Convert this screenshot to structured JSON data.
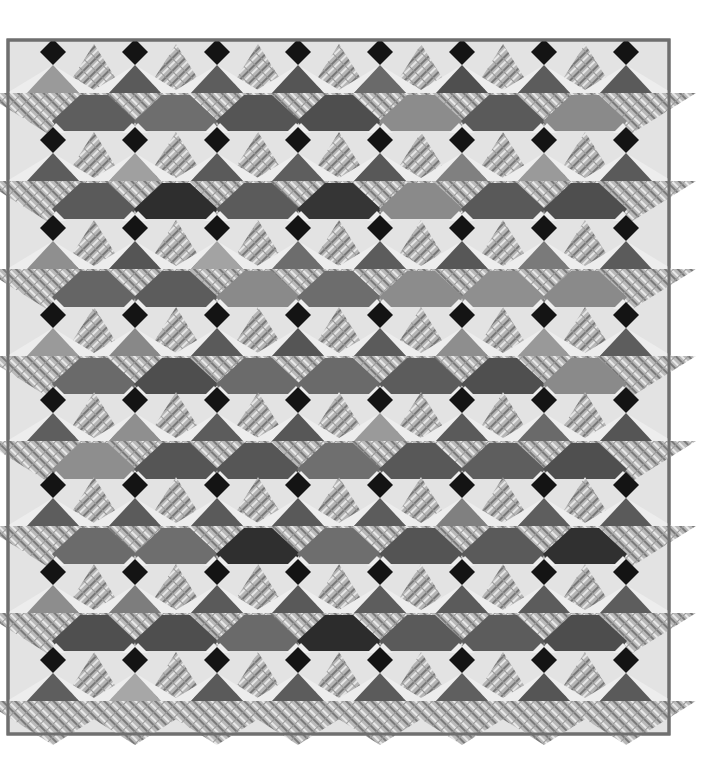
{
  "image": {
    "subject": "Patchwork quilt with black diamonds, flying-geese plaid triangles and colored trapezoid patches",
    "background": "#ffffff",
    "quilt": {
      "left": 8,
      "top": 40,
      "right": 669,
      "bottom": 734,
      "binding_color": "#6f6f6f",
      "border_color": "#e3e3e3",
      "light_color": "#ededed",
      "diamond_color": "#141414",
      "plaid_base": "#b9b9b9",
      "plaid_stripe_dark": "#7a7a7a",
      "plaid_stripe_light": "#e9e9e9"
    },
    "grid": {
      "columns_x": [
        53,
        135,
        217,
        298,
        380,
        462,
        544,
        626
      ],
      "rows_y": [
        52,
        140,
        228,
        315,
        400,
        485,
        572,
        660
      ],
      "diamond_half": 13,
      "small_tri_height": 30,
      "small_tri_half_width": 26,
      "goose_half_width": 70,
      "goose_height": 40,
      "trap_top_half": 24,
      "trap_bottom_half": 42,
      "trap_height": 38
    },
    "small_triangle_tones": [
      [
        "#9a9a9a",
        "#5a5a5a",
        "#5d5d5d",
        "#555555",
        "#6a6a6a",
        "#4f4f4f",
        "#5c5c5c",
        "#5a5a5a"
      ],
      [
        "#5c5c5c",
        "#a0a0a0",
        "#5a5a5a",
        "#5e5e5e",
        "#585858",
        "#808080",
        "#9a9a9a",
        "#5a5a5a"
      ],
      [
        "#8f8f8f",
        "#555555",
        "#a3a3a3",
        "#6d6d6d",
        "#5c5c5c",
        "#575757",
        "#7a7a7a",
        "#5b5b5b"
      ],
      [
        "#9a9a9a",
        "#888888",
        "#5a5a5a",
        "#555555",
        "#5b5b5b",
        "#8e8e8e",
        "#999999",
        "#5d5d5d"
      ],
      [
        "#5e5e5e",
        "#8f8f8f",
        "#5c5c5c",
        "#575757",
        "#9a9a9a",
        "#5a5a5a",
        "#6a6a6a",
        "#555555"
      ],
      [
        "#5d5d5d",
        "#5b5b5b",
        "#5a5a5a",
        "#595959",
        "#5c5c5c",
        "#808080",
        "#5e5e5e",
        "#5a5a5a"
      ],
      [
        "#8d8d8d",
        "#7d7d7d",
        "#5a5a5a",
        "#595959",
        "#5d5d5d",
        "#5b5b5b",
        "#5c5c5c",
        "#5d5d5d"
      ],
      [
        "#5e5e5e",
        "#a7a7a7",
        "#5a5a5a",
        "#5c5c5c",
        "#5b5b5b",
        "#5f5f5f",
        "#555555",
        "#5a5a5a"
      ]
    ],
    "trapezoid_tones": [
      [
        "#5e5e5e",
        "#6e6e6e",
        "#555555",
        "#4e4e4e",
        "#8c8c8c",
        "#5a5a5a",
        "#8a8a8a"
      ],
      [
        "#5a5a5a",
        "#2e2e2e",
        "#5b5b5b",
        "#353535",
        "#8a8a8a",
        "#595959",
        "#4e4e4e"
      ],
      [
        "#656565",
        "#5c5c5c",
        "#8a8a8a",
        "#6d6d6d",
        "#8c8c8c",
        "#8f8f8f",
        "#8a8a8a"
      ],
      [
        "#6a6a6a",
        "#4e4e4e",
        "#6b6b6b",
        "#6a6a6a",
        "#5c5c5c",
        "#4f4f4f",
        "#8a8a8a"
      ],
      [
        "#8e8e8e",
        "#555555",
        "#565656",
        "#6f6f6f",
        "#585858",
        "#5e5e5e",
        "#4f4f4f"
      ],
      [
        "#6b6b6b",
        "#6e6e6e",
        "#2f2f2f",
        "#6e6e6e",
        "#545454",
        "#5a5a5a",
        "#303030"
      ],
      [
        "#4f4f4f",
        "#4e4e4e",
        "#6a6a6a",
        "#2c2c2c",
        "#5a5a5a",
        "#5c5c5c",
        "#4d4d4d"
      ],
      []
    ]
  }
}
